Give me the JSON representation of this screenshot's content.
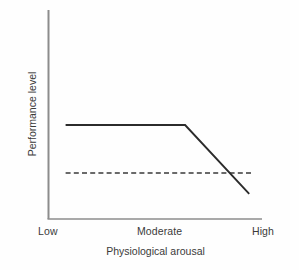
{
  "chart_data": {
    "type": "line",
    "title": "",
    "subtitle": "",
    "xlabel": "Physiological arousal",
    "ylabel": "Performance level",
    "xlim": [
      0,
      100
    ],
    "ylim": [
      0,
      100
    ],
    "grid": false,
    "legend": null,
    "x_tick_labels": [
      "Low",
      "Moderate",
      "High"
    ],
    "x_tick_values": [
      8,
      64,
      96
    ],
    "y_tick_labels": [],
    "series": [
      {
        "name": "Performance curve",
        "style": "solid",
        "color": "#2b2b2b",
        "x": [
          8,
          64,
          94
        ],
        "y": [
          45,
          45,
          12
        ],
        "description": "Performance stays flat at a high plateau from low through moderate arousal, then declines steeply toward high arousal."
      },
      {
        "name": "Reference threshold",
        "style": "dashed",
        "color": "#3a3a3a",
        "x": [
          8,
          96
        ],
        "y": [
          22,
          22
        ],
        "description": "Horizontal dashed baseline level crossed by the declining performance curve near high arousal."
      }
    ],
    "annotations": []
  },
  "axes": {
    "line_color": "#8c8c8c",
    "y_axis_top_label": "",
    "x_axis_right_label": ""
  },
  "labels": {
    "low": "Low",
    "moderate": "Moderate",
    "high": "High",
    "x_title": "Physiological arousal",
    "y_title": "Performance level"
  },
  "colors": {
    "background": "#fefefe",
    "axis": "#8c8c8c",
    "curve": "#2b2b2b",
    "dashed": "#3a3a3a",
    "text": "#3a3a3a"
  }
}
